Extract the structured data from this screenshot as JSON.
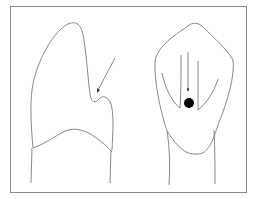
{
  "diagram": {
    "type": "line-illustration",
    "panels": [
      {
        "id": "lateral-view",
        "description": "tooth outline, side view, arrow pointing to notch"
      },
      {
        "id": "frontal-view",
        "description": "tooth outline, front view, grooves with filled dot marker"
      }
    ],
    "colors": {
      "background": "#ffffff",
      "line": "#7a7a7a",
      "frame": "#8a8a8a",
      "marker": "#000000"
    }
  }
}
